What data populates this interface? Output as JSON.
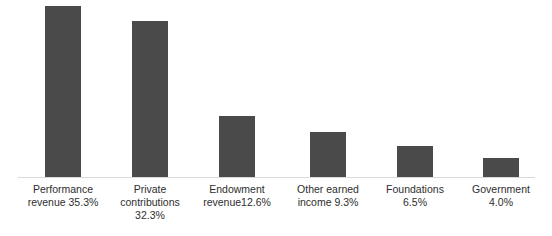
{
  "chart_data": {
    "type": "bar",
    "title": "",
    "subtitle": "",
    "xlabel": "",
    "ylabel": "",
    "grid": false,
    "legend": "none",
    "orientation": "vertical",
    "ylim": [
      0,
      36.5
    ],
    "value_unit": "percent",
    "axis_ticks_visible": false,
    "categories": [
      "Performance revenue",
      "Private contributions",
      "Endowment revenue",
      "Other earned income",
      "Foundations",
      "Government"
    ],
    "values": [
      35.3,
      32.3,
      12.6,
      9.3,
      6.5,
      4.0
    ],
    "value_labels": [
      "35.3%",
      "32.3%",
      "12.6%",
      "9.3%",
      "6.5%",
      "4.0%"
    ],
    "tick_labels": [
      "Performance\nrevenue 35.3%",
      "Private\ncontributions\n32.3%",
      "Endowment\nrevenue12.6%",
      "Other earned\nincome 9.3%",
      "Foundations\n6.5%",
      "Government\n4.0%"
    ]
  },
  "style": {
    "bar_color": "#4a4a4a",
    "axis_color": "#d9d9d9",
    "label_color": "#2e2e2e",
    "background": "#ffffff"
  }
}
